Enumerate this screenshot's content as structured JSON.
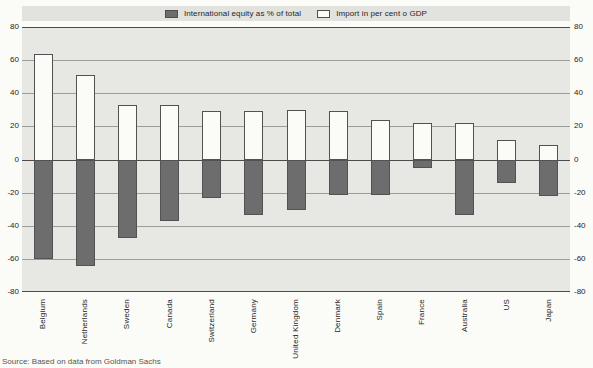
{
  "chart_data": {
    "type": "bar",
    "categories": [
      "Belgium",
      "Netherlands",
      "Sweden",
      "Canada",
      "Switzerland",
      "Germany",
      "United Kingdom",
      "Denmark",
      "Spain",
      "France",
      "Australia",
      "US",
      "Japan"
    ],
    "series": [
      {
        "name": "International equity as % of total",
        "swatch": "dark-gray",
        "color": "#6d6d6d",
        "values": [
          -60,
          -64,
          -47,
          -37,
          -23,
          -33,
          -30,
          -21,
          -21,
          -5,
          -33,
          -14,
          -22
        ]
      },
      {
        "name": "Import in per cent o GDP",
        "swatch": "white",
        "color": "#fbfbf8",
        "values": [
          64,
          51,
          33,
          33,
          29,
          29,
          30,
          29,
          24,
          22,
          22,
          12,
          9
        ]
      }
    ],
    "title": "",
    "xlabel": "",
    "ylabel": "",
    "ylim": [
      -80,
      80
    ],
    "yticks": [
      80,
      60,
      40,
      20,
      0,
      -20,
      -40,
      -60,
      -80
    ],
    "major_gridlines": [
      80,
      0,
      -80
    ],
    "grid": true,
    "legend_position": "top",
    "axis_label_sides": "both"
  },
  "legend": {
    "items": [
      {
        "label": "International equity as % of total"
      },
      {
        "label": "Import in per cent o GDP"
      }
    ]
  },
  "source_note": "Source:  Based on data from Goldman Sachs",
  "colors": {
    "plot_background": "#e7e7e4",
    "legend_band": "#e2e2df",
    "equity_bar": "#6d6d6d",
    "import_bar": "#fbfbf8",
    "bar_border": "#525252",
    "gridline_minor": "#9c9c98",
    "gridline_major": "#4b4b4b"
  }
}
